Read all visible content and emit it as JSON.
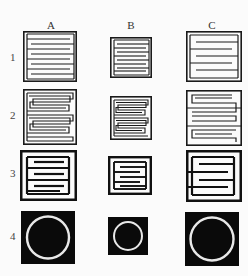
{
  "figure": {
    "columns": [
      {
        "id": "A",
        "label": "A"
      },
      {
        "id": "B",
        "label": "B"
      },
      {
        "id": "C",
        "label": "C"
      }
    ],
    "rows": [
      {
        "id": "1",
        "label": "1",
        "description": "Interdigitated comb electrodes, thin lines"
      },
      {
        "id": "2",
        "label": "2",
        "description": "Serpentine / meander electrodes"
      },
      {
        "id": "3",
        "label": "3",
        "description": "Interdigitated comb electrodes, thick lines, few fingers"
      },
      {
        "id": "4",
        "label": "4",
        "description": "Ring (circle) on black square"
      }
    ],
    "colors": {
      "ink": "#1a1a1a",
      "paper": "#fbfbfb",
      "ring": "#e8e8e8"
    },
    "cells": [
      {
        "row": "1",
        "col": "A",
        "type": "comb-thin",
        "fingers": 9
      },
      {
        "row": "1",
        "col": "B",
        "type": "comb-thin",
        "fingers": 8
      },
      {
        "row": "1",
        "col": "C",
        "type": "comb-thin",
        "fingers": 6
      },
      {
        "row": "2",
        "col": "A",
        "type": "serpentine",
        "turns": 7
      },
      {
        "row": "2",
        "col": "B",
        "type": "serpentine",
        "turns": 7
      },
      {
        "row": "2",
        "col": "C",
        "type": "serpentine",
        "turns": 5
      },
      {
        "row": "3",
        "col": "A",
        "type": "comb-thick",
        "fingers": 4
      },
      {
        "row": "3",
        "col": "B",
        "type": "comb-thick",
        "fingers": 4
      },
      {
        "row": "3",
        "col": "C",
        "type": "comb-thick",
        "fingers": 3
      },
      {
        "row": "4",
        "col": "A",
        "type": "ring"
      },
      {
        "row": "4",
        "col": "B",
        "type": "ring"
      },
      {
        "row": "4",
        "col": "C",
        "type": "ring"
      }
    ]
  }
}
